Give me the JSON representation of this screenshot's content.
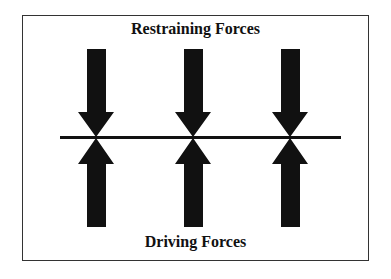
{
  "diagram": {
    "title_top": "Restraining Forces",
    "title_bottom": "Driving Forces",
    "arrow_color": "#111111",
    "line_color": "#111111",
    "arrows": {
      "restraining": [
        {
          "x": 96
        },
        {
          "x": 193
        },
        {
          "x": 290
        }
      ],
      "driving": [
        {
          "x": 96
        },
        {
          "x": 193
        },
        {
          "x": 290
        }
      ]
    }
  }
}
